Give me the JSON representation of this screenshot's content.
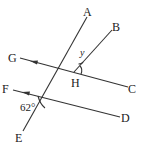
{
  "diagram": {
    "type": "geometry",
    "points": {
      "A": {
        "label": "A",
        "x": 87,
        "y": 12
      },
      "B": {
        "label": "B",
        "x": 116,
        "y": 28
      },
      "G": {
        "label": "G",
        "x": 13,
        "y": 59
      },
      "H": {
        "label": "H",
        "x": 76,
        "y": 84
      },
      "C": {
        "label": "C",
        "x": 133,
        "y": 90
      },
      "F": {
        "label": "F",
        "x": 6,
        "y": 90
      },
      "D": {
        "label": "D",
        "x": 126,
        "y": 119
      },
      "E": {
        "label": "E",
        "x": 19,
        "y": 140
      }
    },
    "angle_labels": {
      "y": "y",
      "given": "62°"
    },
    "colors": {
      "line": "#333333",
      "text": "#222222",
      "background": "#ffffff"
    }
  }
}
